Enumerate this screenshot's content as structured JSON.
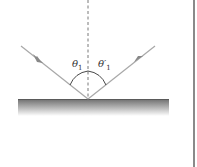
{
  "diagram": {
    "type": "reflection",
    "labels": {
      "incident_angle": "θ",
      "incident_angle_sub": "1",
      "reflected_angle": "θ′",
      "reflected_angle_sub": "1"
    },
    "colors": {
      "ray": "#a8a8a8",
      "normal": "#555555",
      "surface_top": "#6e6e6e",
      "surface_bottom": "#ffffff",
      "arc": "#333333",
      "rule": "#8a8a8a"
    }
  }
}
